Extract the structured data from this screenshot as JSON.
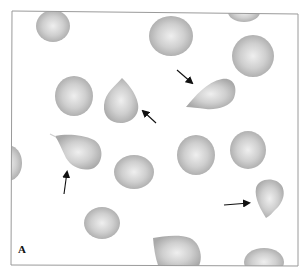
{
  "figure": {
    "panel_label": "A",
    "frame_color": "#9a9a9a",
    "cell_color": "#c4c4c4",
    "arrow_color": "#111111",
    "arrow_count": 5,
    "round_cell_count": 12,
    "teardrop_cell_count": 6
  }
}
